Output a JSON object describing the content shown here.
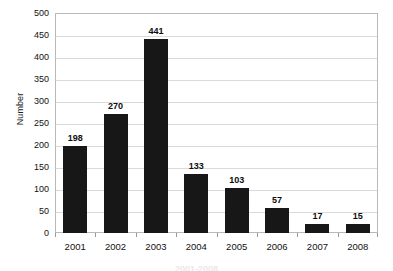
{
  "chart_data": {
    "type": "bar",
    "title": "",
    "xlabel": "",
    "ylabel": "Number",
    "categories": [
      "2001",
      "2002",
      "2003",
      "2004",
      "2005",
      "2006",
      "2007",
      "2008"
    ],
    "values": [
      198,
      270,
      441,
      133,
      103,
      57,
      17,
      15
    ],
    "value_labels": [
      "198",
      "270",
      "441",
      "133",
      "103",
      "57",
      "17",
      "15"
    ],
    "ylim": [
      0,
      500
    ],
    "ytick_step": 50,
    "yticks": [
      500,
      450,
      400,
      350,
      300,
      250,
      200,
      150,
      100,
      50,
      0
    ],
    "ytick_labels": [
      "500",
      "450",
      "400",
      "350",
      "300",
      "250",
      "200",
      "150",
      "100",
      "50",
      "0"
    ],
    "grid": true,
    "grid_axis": "y",
    "legend": false,
    "legend_position": "none",
    "series": [
      {
        "name": "Number",
        "values": [
          198,
          270,
          441,
          133,
          103,
          57,
          17,
          15
        ]
      }
    ]
  },
  "colors": {
    "bar_fill": "#171717",
    "gridline": "#dadada",
    "frame_border": "#b9b9b9",
    "background": "#ffffff",
    "text": "#111111"
  },
  "caption": {
    "cut_off_text": "2001-2008"
  }
}
